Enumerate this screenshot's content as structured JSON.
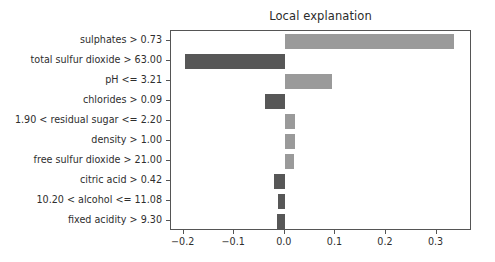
{
  "chart_data": {
    "type": "bar",
    "orientation": "horizontal",
    "title": "Local explanation",
    "xlabel": "",
    "ylabel": "",
    "xlim": [
      -0.225,
      0.37
    ],
    "xticks": [
      -0.2,
      -0.1,
      0.0,
      0.1,
      0.2,
      0.3
    ],
    "xtick_labels": [
      "−0.2",
      "−0.1",
      "0.0",
      "0.1",
      "0.2",
      "0.3"
    ],
    "grid": false,
    "legend": null,
    "categories": [
      "sulphates > 0.73",
      "total sulfur dioxide > 63.00",
      "pH <= 3.21",
      "chlorides > 0.09",
      "1.90 < residual sugar <= 2.20",
      "density > 1.00",
      "free sulfur dioxide > 21.00",
      "citric acid > 0.42",
      "10.20 < alcohol <= 11.08",
      "fixed acidity > 9.30"
    ],
    "values": [
      0.335,
      -0.197,
      0.093,
      -0.04,
      0.021,
      0.02,
      0.018,
      -0.022,
      -0.014,
      -0.015
    ],
    "colors": {
      "positive": "#9a9a9a",
      "negative": "#575757",
      "axis": "#555555",
      "text": "#2e2e2e",
      "background": "#ffffff"
    }
  }
}
